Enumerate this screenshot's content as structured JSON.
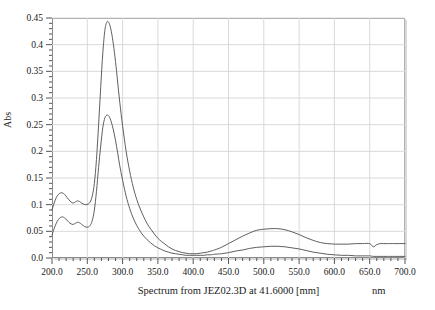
{
  "chart_data": {
    "type": "line",
    "title": "",
    "caption": "Spectrum from JEZ02.3D at 41.6000 [mm]",
    "xlabel": "nm",
    "ylabel": "Abs",
    "xlim": [
      200,
      700
    ],
    "ylim": [
      0.0,
      0.45
    ],
    "grid": true,
    "legend": "none",
    "x_major_step": 50,
    "x_minor_per_major": 5,
    "y_major_step": 0.05,
    "y_minor_per_major": 5,
    "x_tick_labels": [
      "200.0",
      "250.0",
      "300.0",
      "350.0",
      "400.0",
      "450.0",
      "500.0",
      "550.0",
      "600.0",
      "650.0",
      "700.0"
    ],
    "y_tick_labels": [
      "0.0",
      "0.05",
      "0.1",
      "0.15",
      "0.2",
      "0.25",
      "0.3",
      "0.35",
      "0.4",
      "0.45"
    ],
    "line_color": "#4d4d4d",
    "grid_color": "#d9d9d9",
    "axis_color": "#8a8a8a",
    "series": [
      {
        "name": "upper-trace",
        "peak_x": 278,
        "peak_y": 0.443,
        "x": [
          200,
          203,
          206,
          209,
          212,
          215,
          218,
          221,
          224,
          227,
          230,
          233,
          236,
          239,
          242,
          245,
          248,
          251,
          254,
          257,
          260,
          263,
          266,
          269,
          272,
          275,
          278,
          281,
          284,
          287,
          290,
          293,
          296,
          300,
          305,
          310,
          315,
          320,
          325,
          330,
          335,
          340,
          345,
          350,
          355,
          360,
          365,
          370,
          375,
          380,
          385,
          390,
          395,
          400,
          405,
          410,
          415,
          420,
          425,
          430,
          440,
          450,
          460,
          470,
          480,
          490,
          500,
          510,
          520,
          530,
          540,
          550,
          560,
          570,
          580,
          590,
          600,
          610,
          620,
          630,
          640,
          650,
          655,
          660,
          665,
          670,
          675,
          680,
          690,
          700
        ],
        "y": [
          0.09,
          0.103,
          0.113,
          0.119,
          0.122,
          0.122,
          0.119,
          0.114,
          0.109,
          0.105,
          0.103,
          0.105,
          0.107,
          0.106,
          0.103,
          0.101,
          0.1,
          0.101,
          0.105,
          0.116,
          0.14,
          0.185,
          0.25,
          0.32,
          0.385,
          0.428,
          0.443,
          0.44,
          0.425,
          0.4,
          0.368,
          0.33,
          0.292,
          0.248,
          0.2,
          0.163,
          0.133,
          0.11,
          0.092,
          0.077,
          0.064,
          0.054,
          0.045,
          0.037,
          0.031,
          0.026,
          0.021,
          0.017,
          0.014,
          0.012,
          0.01,
          0.009,
          0.008,
          0.008,
          0.008,
          0.009,
          0.01,
          0.011,
          0.013,
          0.015,
          0.02,
          0.027,
          0.034,
          0.041,
          0.047,
          0.052,
          0.054,
          0.055,
          0.055,
          0.053,
          0.049,
          0.044,
          0.038,
          0.033,
          0.029,
          0.027,
          0.026,
          0.026,
          0.026,
          0.027,
          0.027,
          0.027,
          0.021,
          0.025,
          0.027,
          0.027,
          0.027,
          0.027,
          0.027,
          0.027
        ]
      },
      {
        "name": "lower-trace",
        "peak_x": 278,
        "peak_y": 0.268,
        "x": [
          200,
          203,
          206,
          209,
          212,
          215,
          218,
          221,
          224,
          227,
          230,
          233,
          236,
          239,
          242,
          245,
          248,
          251,
          254,
          257,
          260,
          263,
          266,
          269,
          272,
          275,
          278,
          281,
          284,
          287,
          290,
          293,
          296,
          300,
          305,
          310,
          315,
          320,
          325,
          330,
          335,
          340,
          345,
          350,
          355,
          360,
          365,
          370,
          375,
          380,
          385,
          390,
          395,
          400,
          405,
          410,
          415,
          420,
          425,
          430,
          440,
          450,
          460,
          470,
          480,
          490,
          500,
          510,
          520,
          530,
          540,
          550,
          560,
          570,
          580,
          590,
          600,
          610,
          620,
          630,
          640,
          650,
          655,
          660,
          665,
          670,
          675,
          680,
          690,
          700
        ],
        "y": [
          0.043,
          0.055,
          0.065,
          0.072,
          0.076,
          0.077,
          0.075,
          0.071,
          0.067,
          0.064,
          0.063,
          0.065,
          0.067,
          0.066,
          0.063,
          0.06,
          0.058,
          0.058,
          0.061,
          0.07,
          0.09,
          0.125,
          0.17,
          0.21,
          0.245,
          0.263,
          0.268,
          0.265,
          0.255,
          0.24,
          0.22,
          0.197,
          0.173,
          0.146,
          0.116,
          0.093,
          0.075,
          0.061,
          0.05,
          0.041,
          0.034,
          0.028,
          0.023,
          0.019,
          0.016,
          0.013,
          0.011,
          0.009,
          0.008,
          0.007,
          0.006,
          0.005,
          0.005,
          0.005,
          0.005,
          0.005,
          0.005,
          0.006,
          0.006,
          0.007,
          0.008,
          0.01,
          0.013,
          0.015,
          0.018,
          0.02,
          0.021,
          0.022,
          0.022,
          0.021,
          0.019,
          0.017,
          0.014,
          0.011,
          0.009,
          0.007,
          0.006,
          0.005,
          0.005,
          0.004,
          0.004,
          0.004,
          0.003,
          0.003,
          0.003,
          0.003,
          0.003,
          0.003,
          0.003,
          0.003
        ]
      }
    ]
  }
}
